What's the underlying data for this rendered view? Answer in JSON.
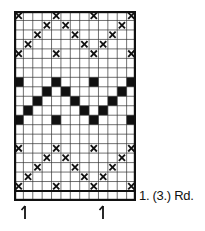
{
  "chart_data": {
    "type": "table",
    "title": "",
    "columns": 13,
    "rows": 19,
    "base_row_label": "1. (3.) Rd.",
    "symbols": {
      "x": "cross stitch symbol",
      "fill": "filled black square"
    },
    "grid": [
      {
        "row": 1,
        "symbol": "x",
        "cols": [
          1,
          5,
          9,
          13
        ]
      },
      {
        "row": 2,
        "symbol": "x",
        "cols": [
          4,
          6,
          12
        ]
      },
      {
        "row": 3,
        "symbol": "x",
        "cols": [
          3,
          7,
          11
        ]
      },
      {
        "row": 4,
        "symbol": "x",
        "cols": [
          2,
          8,
          10
        ]
      },
      {
        "row": 5,
        "symbol": "x",
        "cols": [
          1,
          5,
          9,
          13
        ]
      },
      {
        "row": 6,
        "symbol": "",
        "cols": []
      },
      {
        "row": 7,
        "symbol": "",
        "cols": []
      },
      {
        "row": 8,
        "symbol": "fill",
        "cols": [
          1,
          5,
          9,
          13
        ]
      },
      {
        "row": 9,
        "symbol": "fill",
        "cols": [
          4,
          6,
          12
        ]
      },
      {
        "row": 10,
        "symbol": "fill",
        "cols": [
          3,
          7,
          11
        ]
      },
      {
        "row": 11,
        "symbol": "fill",
        "cols": [
          2,
          8,
          10
        ]
      },
      {
        "row": 12,
        "symbol": "fill",
        "cols": [
          1,
          5,
          9,
          13
        ]
      },
      {
        "row": 13,
        "symbol": "",
        "cols": []
      },
      {
        "row": 14,
        "symbol": "",
        "cols": []
      },
      {
        "row": 15,
        "symbol": "x",
        "cols": [
          1,
          5,
          9,
          13
        ]
      },
      {
        "row": 16,
        "symbol": "x",
        "cols": [
          4,
          6,
          12
        ]
      },
      {
        "row": 17,
        "symbol": "x",
        "cols": [
          3,
          7,
          11
        ]
      },
      {
        "row": 18,
        "symbol": "x",
        "cols": [
          2,
          8,
          10
        ]
      },
      {
        "row": 19,
        "symbol": "x",
        "cols": [
          1,
          5,
          9,
          13
        ]
      }
    ],
    "markers": [
      {
        "type": "arrow-up",
        "col": 2
      },
      {
        "type": "arrow-up",
        "col": 10
      }
    ]
  },
  "labels": {
    "base_row": "1. (3.) Rd."
  },
  "colors": {
    "ink": "#111111",
    "grid_line": "#333333",
    "paper": "#ffffff"
  }
}
